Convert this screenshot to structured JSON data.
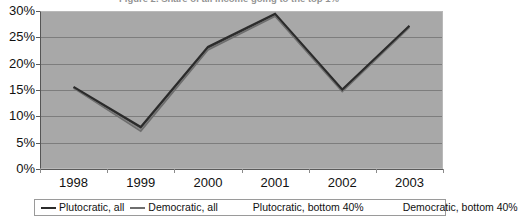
{
  "chart_data": {
    "type": "line",
    "title": "Figure 2.  Share of all income going to the top 1%",
    "xlabel": "",
    "ylabel": "",
    "categories": [
      "1998",
      "1999",
      "2000",
      "2001",
      "2002",
      "2003"
    ],
    "x_tick_labels": [
      "1998",
      "1999",
      "2000",
      "2001",
      "2002",
      "2003"
    ],
    "y_tick_labels": [
      "0%",
      "5%",
      "10%",
      "15%",
      "20%",
      "25%",
      "30%"
    ],
    "y_tick_values": [
      0,
      5,
      10,
      15,
      20,
      25,
      30
    ],
    "ylim": [
      0,
      30
    ],
    "grid": true,
    "legend_position": "bottom",
    "plot_background": "#a8a8a8",
    "series": [
      {
        "name": "Plutocratic, all",
        "color": "#2b2b2b",
        "values": [
          15.6,
          8.0,
          23.2,
          29.5,
          15.1,
          27.2
        ]
      },
      {
        "name": "Democratic, all",
        "color": "#6e6e6e",
        "values": [
          15.4,
          7.2,
          22.6,
          29.0,
          14.7,
          26.9
        ]
      },
      {
        "name": "Plutocratic, bottom 40%",
        "color": "#3d3d3d",
        "values": [
          15.5,
          7.8,
          23.0,
          29.3,
          15.0,
          27.1
        ]
      },
      {
        "name": "Democratic, bottom 40%",
        "color": "#878787",
        "values": [
          15.3,
          7.5,
          22.8,
          29.1,
          14.9,
          27.0
        ]
      }
    ]
  },
  "legend": {
    "items": [
      {
        "label": "Plutocratic, all",
        "swatch": "line"
      },
      {
        "label": "Democratic, all",
        "swatch": "line"
      },
      {
        "label": "Plutocratic, bottom 40%",
        "swatch": "none"
      },
      {
        "label": "Democratic, bottom 40%",
        "swatch": "none"
      }
    ]
  }
}
